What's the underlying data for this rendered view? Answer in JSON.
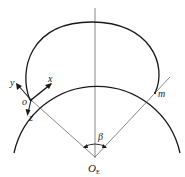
{
  "diagram": {
    "labels": {
      "x_axis": "x",
      "y_axis": "y",
      "z_axis": "z",
      "origin_point": "o",
      "point_m": "m",
      "angle": "β",
      "center": "O",
      "center_subscript": "E"
    },
    "colors": {
      "thick_line": "#1a1a1a",
      "thin_line": "#555555",
      "background": "#ffffff"
    }
  }
}
